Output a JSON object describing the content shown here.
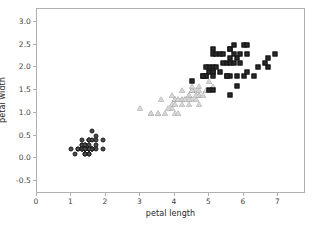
{
  "figure": {
    "background": "#ffffff",
    "spine_color": "#b0b0b0",
    "text_color": "#262626"
  },
  "chart_data": {
    "type": "scatter",
    "title": "",
    "xlabel": "petal length",
    "ylabel": "petal width",
    "xlim": [
      0,
      7.8
    ],
    "ylim": [
      -0.78,
      3.28
    ],
    "xticks": [
      0,
      1,
      2,
      3,
      4,
      5,
      6,
      7
    ],
    "xticklabels": [
      "0",
      "1",
      "2",
      "3",
      "4",
      "5",
      "6",
      "7"
    ],
    "yticks": [
      -0.5,
      0.0,
      0.5,
      1.0,
      1.5,
      2.0,
      2.5,
      3.0
    ],
    "yticklabels": [
      "-0.5",
      "0.0",
      "0.5",
      "1.0",
      "1.5",
      "2.0",
      "2.5",
      "3.0"
    ],
    "grid": false,
    "legend": "none",
    "series": [
      {
        "name": "setosa",
        "marker": "circle",
        "color": "#4d4d4d",
        "edge_color": "#1a1a1a",
        "x": [
          1.4,
          1.4,
          1.3,
          1.5,
          1.4,
          1.7,
          1.4,
          1.5,
          1.4,
          1.5,
          1.5,
          1.6,
          1.4,
          1.1,
          1.2,
          1.5,
          1.3,
          1.4,
          1.7,
          1.5,
          1.7,
          1.5,
          1.0,
          1.7,
          1.9,
          1.6,
          1.6,
          1.5,
          1.4,
          1.6,
          1.6,
          1.5,
          1.5,
          1.4,
          1.5,
          1.2,
          1.3,
          1.4,
          1.3,
          1.5,
          1.3,
          1.3,
          1.3,
          1.6,
          1.9,
          1.4,
          1.6,
          1.4,
          1.5,
          1.4
        ],
        "y": [
          0.2,
          0.2,
          0.2,
          0.2,
          0.2,
          0.4,
          0.3,
          0.2,
          0.2,
          0.1,
          0.2,
          0.2,
          0.1,
          0.1,
          0.2,
          0.4,
          0.4,
          0.3,
          0.3,
          0.3,
          0.2,
          0.4,
          0.2,
          0.5,
          0.2,
          0.2,
          0.4,
          0.2,
          0.2,
          0.2,
          0.2,
          0.4,
          0.1,
          0.2,
          0.2,
          0.2,
          0.2,
          0.1,
          0.2,
          0.2,
          0.3,
          0.3,
          0.2,
          0.6,
          0.4,
          0.3,
          0.2,
          0.2,
          0.2,
          0.2
        ]
      },
      {
        "name": "versicolor",
        "marker": "triangle",
        "color": "#d6d6d6",
        "edge_color": "#6b6b6b",
        "x": [
          4.7,
          4.5,
          4.9,
          4.0,
          4.6,
          4.5,
          4.7,
          3.3,
          4.6,
          3.9,
          3.5,
          4.2,
          4.0,
          4.7,
          3.6,
          4.4,
          4.5,
          4.1,
          4.5,
          3.9,
          4.8,
          4.0,
          4.9,
          4.7,
          4.3,
          4.4,
          4.8,
          5.0,
          4.5,
          3.5,
          3.8,
          3.7,
          3.9,
          5.1,
          4.5,
          4.5,
          4.7,
          4.4,
          4.1,
          4.0,
          4.4,
          4.6,
          4.0,
          3.3,
          4.2,
          4.2,
          4.2,
          4.3,
          3.0,
          4.1
        ],
        "y": [
          1.4,
          1.5,
          1.5,
          1.3,
          1.5,
          1.3,
          1.6,
          1.0,
          1.3,
          1.4,
          1.0,
          1.5,
          1.0,
          1.4,
          1.3,
          1.4,
          1.5,
          1.0,
          1.5,
          1.1,
          1.8,
          1.3,
          1.5,
          1.2,
          1.3,
          1.4,
          1.4,
          1.7,
          1.5,
          1.0,
          1.1,
          1.0,
          1.2,
          1.6,
          1.5,
          1.6,
          1.5,
          1.3,
          1.3,
          1.3,
          1.2,
          1.4,
          1.2,
          1.0,
          1.3,
          1.2,
          1.3,
          1.3,
          1.1,
          1.3
        ]
      },
      {
        "name": "virginica",
        "marker": "square",
        "color": "#2b2b2b",
        "edge_color": "#121212",
        "x": [
          6.0,
          5.1,
          5.9,
          5.6,
          5.8,
          6.6,
          4.5,
          6.3,
          5.8,
          6.1,
          5.1,
          5.3,
          5.5,
          5.0,
          5.1,
          5.3,
          5.5,
          6.7,
          6.9,
          5.0,
          5.7,
          4.9,
          6.7,
          4.9,
          5.7,
          6.0,
          4.8,
          4.9,
          5.6,
          5.8,
          6.1,
          6.4,
          5.6,
          5.1,
          5.6,
          6.1,
          5.6,
          5.5,
          4.8,
          5.4,
          5.6,
          5.1,
          5.1,
          5.9,
          5.7,
          5.2,
          5.0,
          5.2,
          5.4,
          5.1
        ],
        "y": [
          2.5,
          1.9,
          2.1,
          1.8,
          2.2,
          2.1,
          1.7,
          1.8,
          1.8,
          2.5,
          2.0,
          1.9,
          2.1,
          2.0,
          2.4,
          2.3,
          1.8,
          2.2,
          2.3,
          1.5,
          2.3,
          2.0,
          2.0,
          1.8,
          2.1,
          1.8,
          1.8,
          1.8,
          2.1,
          1.6,
          1.9,
          2.0,
          2.2,
          1.5,
          1.4,
          2.3,
          2.4,
          1.8,
          1.8,
          2.1,
          2.4,
          2.3,
          1.9,
          2.3,
          2.5,
          2.3,
          1.9,
          2.0,
          2.3,
          1.8
        ]
      }
    ]
  }
}
